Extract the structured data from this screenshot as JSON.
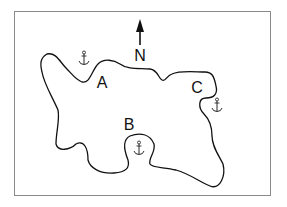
{
  "map": {
    "compass": {
      "label": "N",
      "direction": "north"
    },
    "labels": [
      {
        "id": "A",
        "text": "A"
      },
      {
        "id": "B",
        "text": "B"
      },
      {
        "id": "C",
        "text": "C"
      }
    ],
    "anchors": [
      {
        "id": "anchor-near-A",
        "icon": "anchor-icon"
      },
      {
        "id": "anchor-near-B",
        "icon": "anchor-icon"
      },
      {
        "id": "anchor-near-C",
        "icon": "anchor-icon"
      }
    ],
    "colors": {
      "line": "#111111",
      "border": "#8a8a8a",
      "background": "#ffffff"
    }
  }
}
